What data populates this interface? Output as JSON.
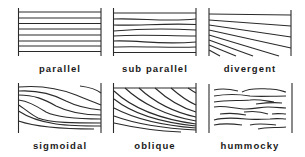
{
  "diagram": {
    "type": "seismic reflection configurations",
    "line_color": "#2a2a2a",
    "panels": [
      {
        "id": "parallel",
        "label": "parallel",
        "row": 1,
        "col": 1
      },
      {
        "id": "sub-parallel",
        "label": "sub parallel",
        "row": 1,
        "col": 2
      },
      {
        "id": "divergent",
        "label": "divergent",
        "row": 1,
        "col": 3
      },
      {
        "id": "sigmoidal",
        "label": "sigmoidal",
        "row": 2,
        "col": 1
      },
      {
        "id": "oblique",
        "label": "oblique",
        "row": 2,
        "col": 2
      },
      {
        "id": "hummocky",
        "label": "hummocky",
        "row": 2,
        "col": 3
      }
    ]
  }
}
